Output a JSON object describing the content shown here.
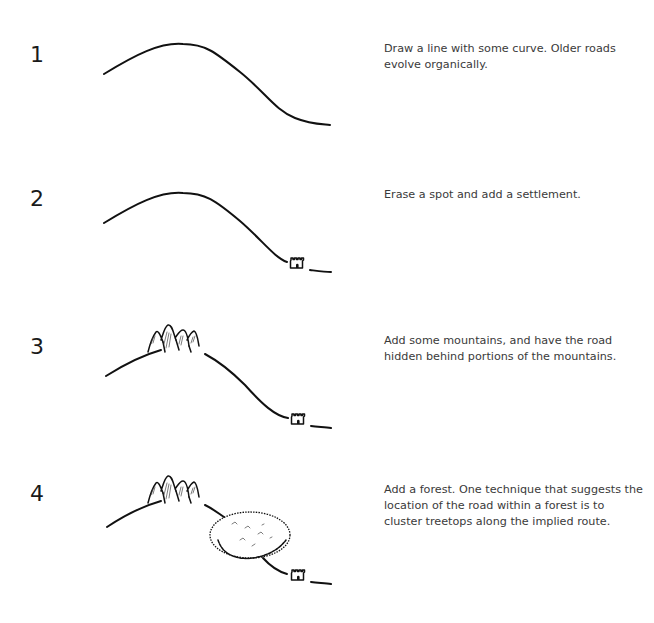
{
  "steps": [
    {
      "number": "1",
      "description": "Draw a line with some curve. Older roads evolve organically.",
      "illustration": [
        "road"
      ]
    },
    {
      "number": "2",
      "description": "Erase a spot and add a settlement.",
      "illustration": [
        "road",
        "settlement-icon"
      ]
    },
    {
      "number": "3",
      "description": "Add some mountains, and have the road hidden behind portions of the mountains.",
      "illustration": [
        "road",
        "settlement-icon",
        "mountains-icon"
      ]
    },
    {
      "number": "4",
      "description": "Add a forest. One technique that suggests the location of the road within a forest is to cluster treetops along the implied route.",
      "illustration": [
        "road",
        "settlement-icon",
        "mountains-icon",
        "forest-icon"
      ]
    }
  ],
  "colors": {
    "ink": "#111111",
    "text": "#3a3a3a",
    "background": "#ffffff"
  }
}
